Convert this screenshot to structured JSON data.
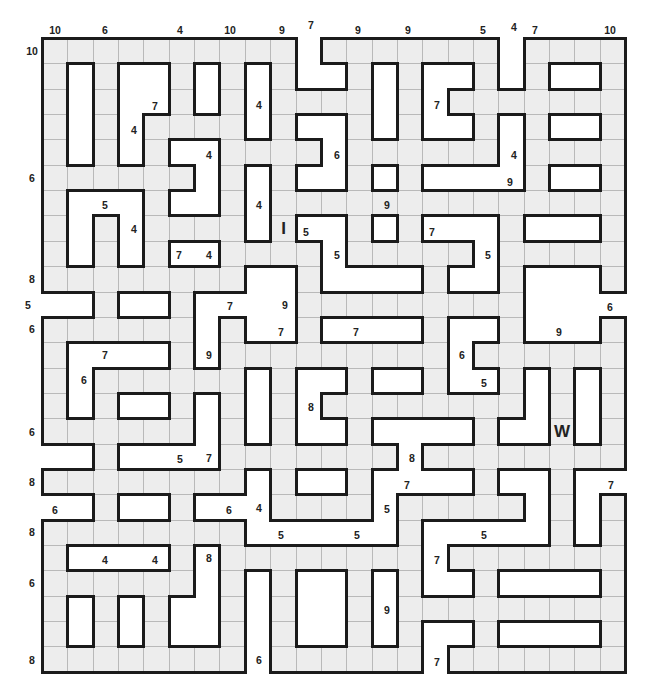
{
  "puzzle": {
    "type": "number-length word fill grid",
    "grid_origin": {
      "x": 42,
      "y": 38
    },
    "cell_size": 25.35,
    "columns": 23,
    "rows": 25,
    "colors": {
      "cell_fill": "#ededed",
      "cell_line": "#b9b9b9",
      "border": "#1b1b1b",
      "background": "#ffffff"
    },
    "legend": "# = grid cell, . = empty space, letters = given letters",
    "grid": [
      "##########.#######.####",
      "#.#..#.#.#..#.#..#.#..#",
      "#.#..#.#.####.#.#######",
      "#.#.####.#..#.#..#.#..#",
      "#.#.#..####.######.####",
      "######.#.#..#.#....#..#",
      "#...#..#.##############",
      "#.#.####.I..#.#...#...#",
      "#.#.#..####.#####.#####",
      "########..#....#..#...#",
      "..#..#....#########....",
      "######.#..#....#..#...#",
      "#....#.#########.######",
      "#.######.#..#..#..#.#.#",
      "#.#..#.#.#.########.#.#",
      "######.#.#..#....#..W.#",
      "..#....#######.########",
      "########.#..#....#..#..",
      "..#..#...####.#####.#.#",
      "########......#.....#.#",
      "#....#.########.#######",
      "######.#.#..#.#..#....#",
      "#.#.#..#.#..#.#########",
      "#.#.#..#.#..#.#..#....#",
      "########.######.#######"
    ],
    "given_letters": [
      {
        "row": 7,
        "col": 9,
        "letter": "I"
      },
      {
        "row": 15,
        "col": 20,
        "letter": "W"
      }
    ],
    "top_clues": [
      {
        "x": 55,
        "y": 30,
        "value": "10"
      },
      {
        "x": 105,
        "y": 30,
        "value": "6"
      },
      {
        "x": 180,
        "y": 30,
        "value": "4"
      },
      {
        "x": 230,
        "y": 30,
        "value": "10"
      },
      {
        "x": 282,
        "y": 30,
        "value": "9"
      },
      {
        "x": 358,
        "y": 30,
        "value": "9"
      },
      {
        "x": 408,
        "y": 30,
        "value": "9"
      },
      {
        "x": 483,
        "y": 30,
        "value": "5"
      },
      {
        "x": 535,
        "y": 30,
        "value": "7"
      },
      {
        "x": 610,
        "y": 30,
        "value": "10"
      }
    ],
    "left_clues": [
      {
        "x": 32,
        "y": 51,
        "value": "10"
      },
      {
        "x": 32,
        "y": 178,
        "value": "6"
      },
      {
        "x": 32,
        "y": 279,
        "value": "8"
      },
      {
        "x": 32,
        "y": 329,
        "value": "6"
      },
      {
        "x": 32,
        "y": 432,
        "value": "6"
      },
      {
        "x": 32,
        "y": 482,
        "value": "8"
      },
      {
        "x": 32,
        "y": 532,
        "value": "8"
      },
      {
        "x": 32,
        "y": 583,
        "value": "6"
      },
      {
        "x": 32,
        "y": 660,
        "value": "8"
      }
    ],
    "inner_clues": [
      {
        "x": 311,
        "y": 25,
        "value": "7"
      },
      {
        "x": 514,
        "y": 27,
        "value": "4"
      },
      {
        "x": 155,
        "y": 106,
        "value": "7"
      },
      {
        "x": 259,
        "y": 105,
        "value": "4"
      },
      {
        "x": 437,
        "y": 105,
        "value": "7"
      },
      {
        "x": 134,
        "y": 130,
        "value": "4"
      },
      {
        "x": 209,
        "y": 155,
        "value": "4"
      },
      {
        "x": 337,
        "y": 155,
        "value": "6"
      },
      {
        "x": 514,
        "y": 155,
        "value": "4"
      },
      {
        "x": 510,
        "y": 182,
        "value": "9"
      },
      {
        "x": 105,
        "y": 205,
        "value": "5"
      },
      {
        "x": 259,
        "y": 205,
        "value": "4"
      },
      {
        "x": 387,
        "y": 205,
        "value": "9"
      },
      {
        "x": 134,
        "y": 229,
        "value": "4"
      },
      {
        "x": 306,
        "y": 232,
        "value": "5"
      },
      {
        "x": 432,
        "y": 232,
        "value": "7"
      },
      {
        "x": 179,
        "y": 255,
        "value": "7"
      },
      {
        "x": 209,
        "y": 255,
        "value": "4"
      },
      {
        "x": 337,
        "y": 255,
        "value": "5"
      },
      {
        "x": 488,
        "y": 255,
        "value": "5"
      },
      {
        "x": 28,
        "y": 305,
        "value": "5"
      },
      {
        "x": 230,
        "y": 306,
        "value": "7"
      },
      {
        "x": 285,
        "y": 305,
        "value": "9"
      },
      {
        "x": 610,
        "y": 307,
        "value": "6"
      },
      {
        "x": 281,
        "y": 332,
        "value": "7"
      },
      {
        "x": 356,
        "y": 332,
        "value": "7"
      },
      {
        "x": 559,
        "y": 332,
        "value": "9"
      },
      {
        "x": 105,
        "y": 355,
        "value": "7"
      },
      {
        "x": 209,
        "y": 355,
        "value": "9"
      },
      {
        "x": 462,
        "y": 355,
        "value": "6"
      },
      {
        "x": 84,
        "y": 380,
        "value": "6"
      },
      {
        "x": 484,
        "y": 383,
        "value": "5"
      },
      {
        "x": 311,
        "y": 407,
        "value": "8"
      },
      {
        "x": 180,
        "y": 459,
        "value": "5"
      },
      {
        "x": 209,
        "y": 458,
        "value": "7"
      },
      {
        "x": 412,
        "y": 458,
        "value": "8"
      },
      {
        "x": 407,
        "y": 485,
        "value": "7"
      },
      {
        "x": 611,
        "y": 485,
        "value": "7"
      },
      {
        "x": 55,
        "y": 510,
        "value": "6"
      },
      {
        "x": 229,
        "y": 510,
        "value": "6"
      },
      {
        "x": 259,
        "y": 508,
        "value": "4"
      },
      {
        "x": 387,
        "y": 509,
        "value": "5"
      },
      {
        "x": 281,
        "y": 535,
        "value": "5"
      },
      {
        "x": 357,
        "y": 535,
        "value": "5"
      },
      {
        "x": 484,
        "y": 535,
        "value": "5"
      },
      {
        "x": 105,
        "y": 560,
        "value": "4"
      },
      {
        "x": 155,
        "y": 560,
        "value": "4"
      },
      {
        "x": 209,
        "y": 558,
        "value": "8"
      },
      {
        "x": 437,
        "y": 560,
        "value": "7"
      },
      {
        "x": 387,
        "y": 610,
        "value": "9"
      },
      {
        "x": 259,
        "y": 660,
        "value": "6"
      },
      {
        "x": 437,
        "y": 662,
        "value": "7"
      }
    ]
  }
}
